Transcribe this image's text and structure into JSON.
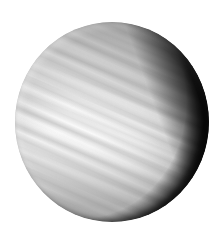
{
  "image": {
    "subject": "planet",
    "description": "Grayscale image of a banded planet disk with a dark shadowed crescent on the right side",
    "colors": {
      "background": "#ffffff",
      "highlight": "#ffffff",
      "midtone": "#bdbdbd",
      "shadow": "#000000"
    }
  }
}
